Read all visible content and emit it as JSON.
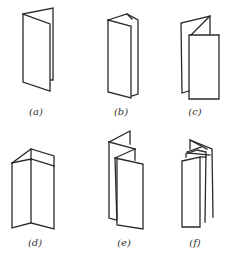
{
  "figures": [
    {
      "id": "a",
      "label": "(a)",
      "description": "two-panel single fold"
    },
    {
      "id": "b",
      "label": "(b)",
      "description": "three-panel roll fold, folded in"
    },
    {
      "id": "c",
      "label": "(c)",
      "description": "three-panel roll fold, open flap"
    },
    {
      "id": "d",
      "label": "(d)",
      "description": "three-panel fold, standing open"
    },
    {
      "id": "e",
      "label": "(e)",
      "description": "four-panel accordion fold"
    },
    {
      "id": "f",
      "label": "(f)",
      "description": "multi-panel accordion fold, closed"
    }
  ],
  "colors": {
    "line": "#2a2a2a",
    "label": "#333333",
    "background": "#ffffff"
  }
}
